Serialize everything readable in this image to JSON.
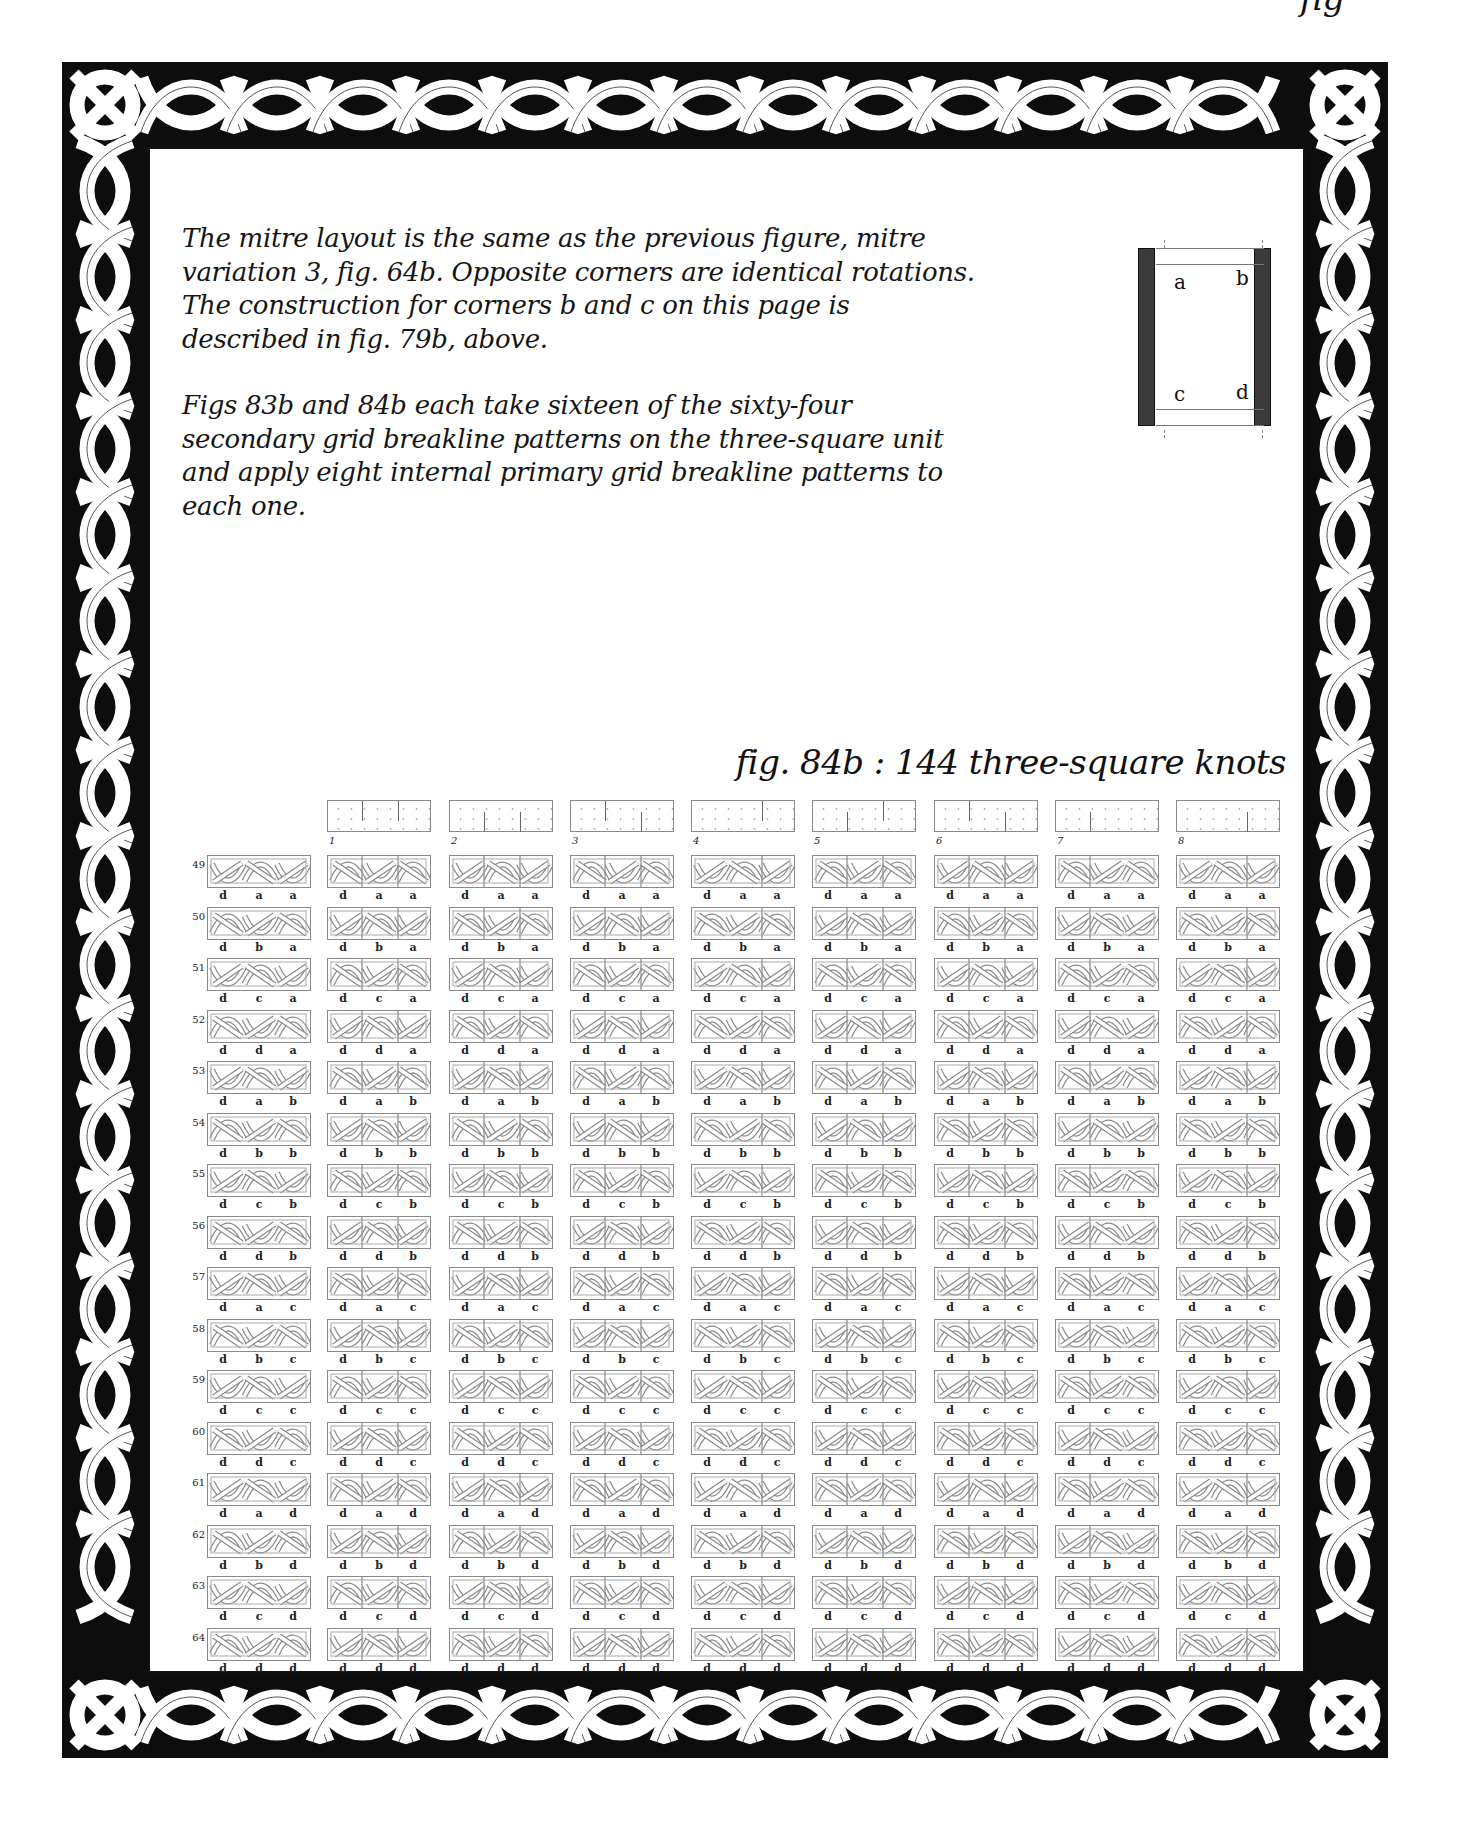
{
  "page": {
    "running_head": "fig",
    "intro_paragraphs": [
      "The mitre layout is the same as the previous figure, mitre variation 3, fig. 64b. Opposite corners are identical rotations. The construction for corners b and c on this page is described in fig. 79b, above.",
      "Figs 83b and 84b each take sixteen of the sixty-four secondary grid breakline patterns on the three-square unit and apply eight internal primary grid breakline patterns to each one."
    ],
    "corner_diagram": {
      "labels": {
        "a": "a",
        "b": "b",
        "c": "c",
        "d": "d"
      }
    },
    "figure_caption": "fig. 84b : 144 three-square knots"
  },
  "figure": {
    "total_knots": 144,
    "column_headers": [
      {
        "number": "1",
        "breaks": [
          {
            "x": 0.33,
            "from": "top"
          },
          {
            "x": 0.67,
            "from": "top"
          }
        ]
      },
      {
        "number": "2",
        "breaks": [
          {
            "x": 0.33,
            "from": "bottom"
          },
          {
            "x": 0.67,
            "from": "bottom"
          }
        ]
      },
      {
        "number": "3",
        "breaks": [
          {
            "x": 0.33,
            "from": "top"
          },
          {
            "x": 0.67,
            "from": "bottom"
          }
        ]
      },
      {
        "number": "4",
        "breaks": [
          {
            "x": 0.67,
            "from": "top"
          }
        ]
      },
      {
        "number": "5",
        "breaks": [
          {
            "x": 0.33,
            "from": "bottom"
          },
          {
            "x": 0.67,
            "from": "top"
          }
        ]
      },
      {
        "number": "6",
        "breaks": [
          {
            "x": 0.33,
            "from": "top"
          },
          {
            "x": 0.67,
            "from": "bottom"
          }
        ]
      },
      {
        "number": "7",
        "breaks": [
          {
            "x": 0.33,
            "from": "bottom"
          }
        ]
      },
      {
        "number": "8",
        "breaks": [
          {
            "x": 0.67,
            "from": "bottom"
          }
        ]
      }
    ],
    "rows": [
      {
        "number": "49",
        "labels": [
          "d",
          "a",
          "a"
        ]
      },
      {
        "number": "50",
        "labels": [
          "d",
          "b",
          "a"
        ]
      },
      {
        "number": "51",
        "labels": [
          "d",
          "c",
          "a"
        ]
      },
      {
        "number": "52",
        "labels": [
          "d",
          "d",
          "a"
        ]
      },
      {
        "number": "53",
        "labels": [
          "d",
          "a",
          "b"
        ]
      },
      {
        "number": "54",
        "labels": [
          "d",
          "b",
          "b"
        ]
      },
      {
        "number": "55",
        "labels": [
          "d",
          "c",
          "b"
        ]
      },
      {
        "number": "56",
        "labels": [
          "d",
          "d",
          "b"
        ]
      },
      {
        "number": "57",
        "labels": [
          "d",
          "a",
          "c"
        ]
      },
      {
        "number": "58",
        "labels": [
          "d",
          "b",
          "c"
        ]
      },
      {
        "number": "59",
        "labels": [
          "d",
          "c",
          "c"
        ]
      },
      {
        "number": "60",
        "labels": [
          "d",
          "d",
          "c"
        ]
      },
      {
        "number": "61",
        "labels": [
          "d",
          "a",
          "d"
        ]
      },
      {
        "number": "62",
        "labels": [
          "d",
          "b",
          "d"
        ]
      },
      {
        "number": "63",
        "labels": [
          "d",
          "c",
          "d"
        ]
      },
      {
        "number": "64",
        "labels": [
          "d",
          "d",
          "d"
        ]
      }
    ]
  },
  "colors": {
    "ink": "#111111",
    "border_fill": "#0d0d0d",
    "knot_line": "#8a8a8a",
    "diagram_bar": "#3a3a3a",
    "paper": "#ffffff"
  }
}
